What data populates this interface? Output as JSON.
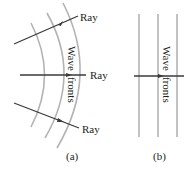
{
  "panel_a": {
    "caption": "(a)",
    "ray_labels": [
      "Ray",
      "Ray",
      "Ray"
    ],
    "wavefront_label_line1": "Wave",
    "wavefront_label_line2": "fronts"
  },
  "panel_b": {
    "caption": "(b)",
    "wavefront_label_line1": "Wave",
    "wavefront_label_line2": "fronts"
  },
  "colors": {
    "wavefront": "#b3b3b3",
    "ray": "#3a3a3a",
    "text": "#231f20"
  }
}
